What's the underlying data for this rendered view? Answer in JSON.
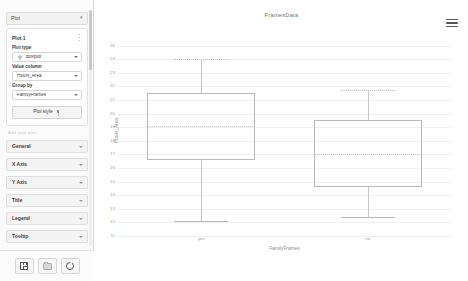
{
  "sidebar": {
    "panel_title": "Plot",
    "panel_collapse_icon": "chevron-icon",
    "plot_card": {
      "name": "Plot 1",
      "menu_icon": "more-vertical-icon",
      "fields": [
        {
          "label": "Plot type",
          "value": "Boxplot",
          "icon": "boxplot-icon"
        },
        {
          "label": "Value column",
          "value": "Hours_Area",
          "icon": ""
        },
        {
          "label": "Group by",
          "value": "FamilyFrames",
          "icon": ""
        }
      ],
      "style_button": "Plot style",
      "style_button_icon": "brush-icon"
    },
    "hint_text": "Add new plot",
    "sections": [
      {
        "label": "General"
      },
      {
        "label": "X Axis"
      },
      {
        "label": "Y Axis"
      },
      {
        "label": "Title"
      },
      {
        "label": "Legend"
      },
      {
        "label": "Tooltip"
      }
    ]
  },
  "bottom_toolbar": {
    "buttons": [
      {
        "name": "save-button",
        "icon": "save-icon"
      },
      {
        "name": "open-button",
        "icon": "folder-icon"
      },
      {
        "name": "refresh-button",
        "icon": "refresh-icon"
      }
    ]
  },
  "chart_menu_icon": "hamburger-menu-icon",
  "chart_data": {
    "type": "box",
    "title": "FramesData",
    "xlabel": "FamilyFrames",
    "ylabel": "Hours_Area",
    "grid": true,
    "legend": "none",
    "categories": [
      "yes",
      "no"
    ],
    "ylim": [
      11,
      26
    ],
    "yticks": [
      11,
      12,
      13,
      14,
      15,
      16,
      17,
      18,
      19,
      20,
      21,
      22,
      23,
      24,
      25
    ],
    "boxes": [
      {
        "category": "yes",
        "min": 12.1,
        "q1": 16.6,
        "median": 19.1,
        "q3": 21.5,
        "max": 24.0,
        "whisker_low": 12.1,
        "whisker_high": 24.0
      },
      {
        "category": "no",
        "min": 12.4,
        "q1": 14.6,
        "median": 17.0,
        "q3": 19.5,
        "max": 21.7,
        "whisker_low": 12.4,
        "whisker_high": 21.7
      }
    ]
  }
}
